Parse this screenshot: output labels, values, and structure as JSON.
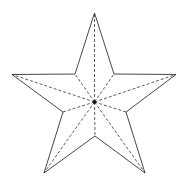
{
  "diagram": {
    "type": "five-pointed-star",
    "center": [
      94.5,
      102
    ],
    "outer_points": [
      [
        94.5,
        13
      ],
      [
        176,
        74.5
      ],
      [
        145,
        173
      ],
      [
        44,
        173
      ],
      [
        12,
        74.5
      ]
    ],
    "inner_points": [
      [
        114,
        74
      ],
      [
        126,
        112
      ],
      [
        95,
        136
      ],
      [
        63,
        112
      ],
      [
        75,
        74
      ]
    ],
    "outline_color": "#333333",
    "dashed_color": "#333333",
    "center_dot_color": "#111111"
  }
}
